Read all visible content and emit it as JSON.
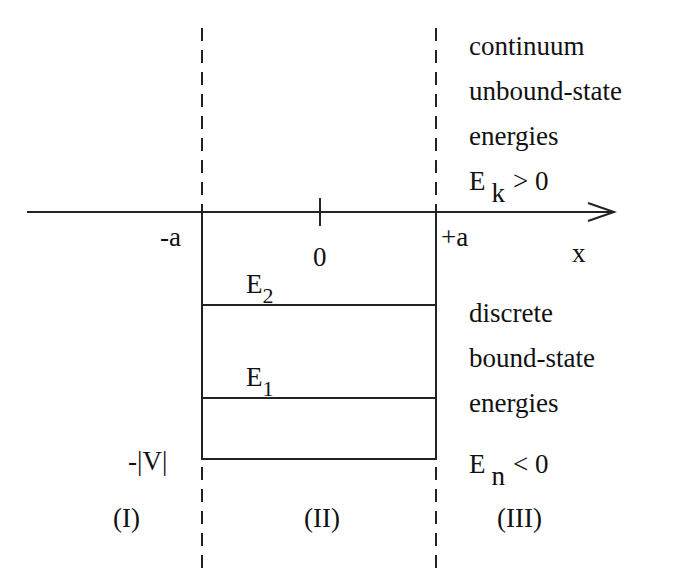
{
  "diagram": {
    "axis": {
      "label": "x",
      "ticks": {
        "left": "-a",
        "origin": "0",
        "right": "+a"
      }
    },
    "well_depth_label": "-|V|",
    "levels": [
      {
        "name": "E",
        "sub": "2"
      },
      {
        "name": "E",
        "sub": "1"
      }
    ],
    "regions": [
      "(I)",
      "(II)",
      "(III)"
    ],
    "continuum": {
      "lines": [
        "continuum",
        "unbound-state",
        "energies"
      ],
      "condition": {
        "E": "E",
        "sub": "k",
        "rel": "> 0"
      }
    },
    "bound": {
      "lines": [
        "discrete",
        "bound-state",
        "energies"
      ],
      "condition": {
        "E": "E",
        "sub": "n",
        "rel": "< 0"
      }
    },
    "colors": {
      "ink": "#222222",
      "background": "#ffffff"
    }
  }
}
